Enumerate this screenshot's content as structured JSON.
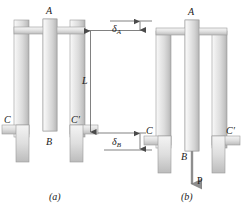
{
  "figure": {
    "panels": [
      {
        "id": "a",
        "caption": "(a)",
        "state": "unloaded",
        "labels": {
          "top_plate_point": "A",
          "middle_bar_bottom_point": "B",
          "left_support_point": "C",
          "right_support_point": "C′",
          "length_dimension": "L"
        }
      },
      {
        "id": "b",
        "caption": "(b)",
        "state": "loaded",
        "labels": {
          "top_plate_point": "A",
          "middle_bar_bottom_point": "B",
          "left_support_point": "C",
          "right_support_point": "C′",
          "force": "P"
        }
      }
    ],
    "dimensions": {
      "delta_a": {
        "symbol": "δ",
        "subscript": "A",
        "description": "deflection at point A"
      },
      "delta_b": {
        "symbol": "δ",
        "subscript": "B",
        "description": "deflection at point B"
      },
      "length": {
        "symbol": "L",
        "description": "bar length between A and C′"
      }
    },
    "colors": {
      "bar_light": "#f2f2f2",
      "bar_mid": "#d9d9d9",
      "bar_dark": "#b8b8b8",
      "outline": "#9a9a9a",
      "dimension_line": "#4a4a4a",
      "text": "#1a1a1a",
      "background": "#ffffff"
    }
  }
}
